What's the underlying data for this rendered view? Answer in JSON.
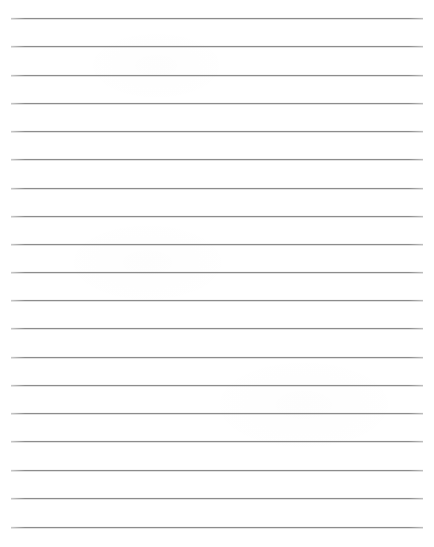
{
  "document": {
    "kind": "lined-paper-sheet",
    "title": "Blank Lined Paper",
    "page_width": 434,
    "page_height": 547,
    "background_color": "#ffffff",
    "body_text": ""
  },
  "ruling": {
    "line_count": 19,
    "line_color": "#8c8c8c",
    "line_thickness_px": 1,
    "first_line_y": 18,
    "line_spacing_px": 28.3,
    "left_margin_x": 11,
    "right_edge_x": 423,
    "line_length_px": 412,
    "margin_rule": "none",
    "lines": [
      {
        "index": 1,
        "y": 18,
        "x_start": 11,
        "x_end": 423,
        "content": ""
      },
      {
        "index": 2,
        "y": 46,
        "x_start": 11,
        "x_end": 423,
        "content": ""
      },
      {
        "index": 3,
        "y": 75,
        "x_start": 11,
        "x_end": 423,
        "content": ""
      },
      {
        "index": 4,
        "y": 103,
        "x_start": 11,
        "x_end": 423,
        "content": ""
      },
      {
        "index": 5,
        "y": 131,
        "x_start": 11,
        "x_end": 423,
        "content": ""
      },
      {
        "index": 6,
        "y": 159,
        "x_start": 11,
        "x_end": 423,
        "content": ""
      },
      {
        "index": 7,
        "y": 188,
        "x_start": 11,
        "x_end": 423,
        "content": ""
      },
      {
        "index": 8,
        "y": 216,
        "x_start": 11,
        "x_end": 423,
        "content": ""
      },
      {
        "index": 9,
        "y": 244,
        "x_start": 11,
        "x_end": 423,
        "content": ""
      },
      {
        "index": 10,
        "y": 272,
        "x_start": 11,
        "x_end": 423,
        "content": ""
      },
      {
        "index": 11,
        "y": 300,
        "x_start": 11,
        "x_end": 423,
        "content": ""
      },
      {
        "index": 12,
        "y": 328,
        "x_start": 11,
        "x_end": 423,
        "content": ""
      },
      {
        "index": 13,
        "y": 357,
        "x_start": 11,
        "x_end": 423,
        "content": ""
      },
      {
        "index": 14,
        "y": 385,
        "x_start": 11,
        "x_end": 423,
        "content": ""
      },
      {
        "index": 15,
        "y": 413,
        "x_start": 11,
        "x_end": 423,
        "content": ""
      },
      {
        "index": 16,
        "y": 441,
        "x_start": 11,
        "x_end": 423,
        "content": ""
      },
      {
        "index": 17,
        "y": 470,
        "x_start": 11,
        "x_end": 423,
        "content": ""
      },
      {
        "index": 18,
        "y": 498,
        "x_start": 11,
        "x_end": 423,
        "content": ""
      },
      {
        "index": 19,
        "y": 527,
        "x_start": 11,
        "x_end": 423,
        "content": ""
      }
    ]
  }
}
